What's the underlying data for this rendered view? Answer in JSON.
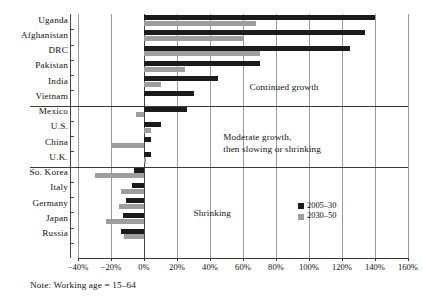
{
  "note": "Note: Working age = 15–64",
  "legend": {
    "items": [
      {
        "label": "2005–30",
        "color": "#1b1b1b",
        "name": "series-2005-30"
      },
      {
        "label": "2030–50",
        "color": "#9e9e9e",
        "name": "series-2030-50"
      }
    ]
  },
  "annotations": [
    {
      "text": "Continued growth",
      "x_pct": 64,
      "row": 4.45,
      "name": "annotation-continued-growth"
    },
    {
      "text": "Moderate growth,",
      "x_pct": 48,
      "row": 7.75,
      "name": "annotation-moderate-growth-line1"
    },
    {
      "text": "then slowing or shrinking",
      "x_pct": 48,
      "row": 8.55,
      "name": "annotation-moderate-growth-line2"
    },
    {
      "text": "Shrinking",
      "x_pct": 30,
      "row": 12.7,
      "name": "annotation-shrinking"
    }
  ],
  "group_dividers": [
    6,
    10
  ],
  "chart_data": {
    "type": "bar",
    "orientation": "horizontal",
    "title": "",
    "subtitle": "",
    "xlabel": "",
    "ylabel": "",
    "xlim": [
      -40,
      160
    ],
    "xticks": [
      -40,
      -20,
      0,
      20,
      40,
      60,
      80,
      100,
      120,
      140,
      160
    ],
    "xtick_labels": [
      "−40%",
      "−20%",
      "0%",
      "20%",
      "40%",
      "60%",
      "80%",
      "100%",
      "120%",
      "140%",
      "160%"
    ],
    "grid": true,
    "legend_position": "inside-right",
    "categories": [
      "Uganda",
      "Afghanistan",
      "DRC",
      "Pakistan",
      "India",
      "Vietnam",
      "Mexico",
      "U.S.",
      "China",
      "U.K.",
      "So. Korea",
      "Italy",
      "Germany",
      "Japan",
      "Russia"
    ],
    "series": [
      {
        "name": "2005–30",
        "color": "#1b1b1b",
        "values": [
          140,
          134,
          125,
          70,
          45,
          30,
          26,
          10,
          4,
          4,
          -6,
          -7,
          -11,
          -13,
          -14
        ]
      },
      {
        "name": "2030–50",
        "color": "#9e9e9e",
        "values": [
          68,
          60,
          70,
          25,
          10,
          0,
          -5,
          4,
          -20,
          1,
          -30,
          -14,
          -15,
          -23,
          -12
        ]
      }
    ],
    "groups": [
      {
        "label": "Continued growth",
        "categories": [
          "Uganda",
          "Afghanistan",
          "DRC",
          "Pakistan",
          "India",
          "Vietnam"
        ]
      },
      {
        "label": "Moderate growth, then slowing or shrinking",
        "categories": [
          "Mexico",
          "U.S.",
          "China",
          "U.K."
        ]
      },
      {
        "label": "Shrinking",
        "categories": [
          "So. Korea",
          "Italy",
          "Germany",
          "Japan",
          "Russia"
        ]
      }
    ]
  }
}
